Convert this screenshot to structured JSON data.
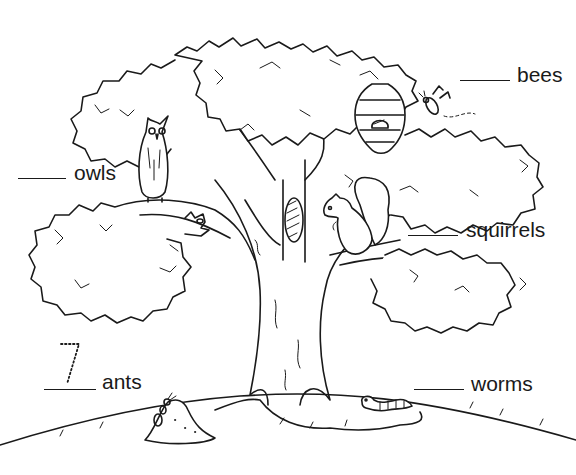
{
  "worksheet": {
    "labels": {
      "owls": "owls",
      "bees": "bees",
      "squirrels": "squirrels",
      "ants": "ants",
      "worms": "worms"
    },
    "example_answer": {
      "for": "ants",
      "value": "7",
      "style": "dotted trace"
    },
    "icons": [
      "tree-icon",
      "owl-icon",
      "beehive-icon",
      "bee-icon",
      "squirrel-icon",
      "tree-hollow-icon",
      "anthill-icon",
      "ant-icon",
      "worm-icon"
    ],
    "colors": {
      "ink": "#1a1a1a",
      "paper": "#ffffff"
    }
  }
}
